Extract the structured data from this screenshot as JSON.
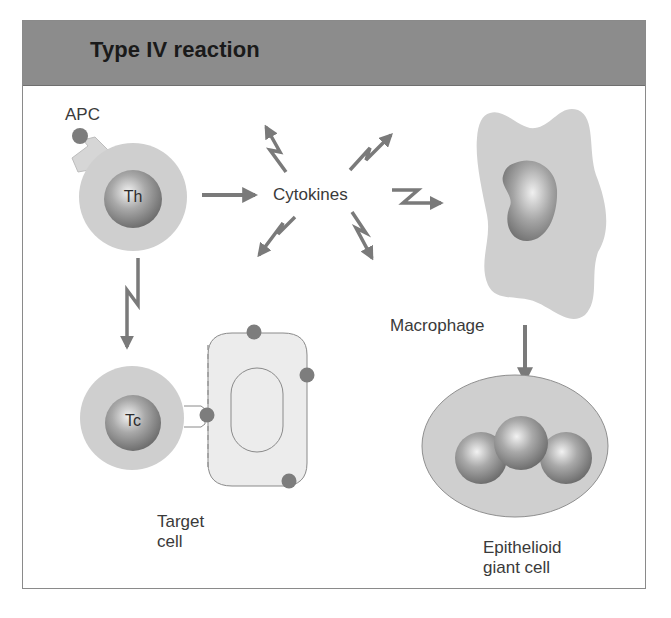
{
  "title": "Type IV reaction",
  "labels": {
    "apc": "APC",
    "th": "Th",
    "tc": "Tc",
    "cytokines": "Cytokines",
    "macrophage": "Macrophage",
    "target_cell_line1": "Target",
    "target_cell_line2": "cell",
    "giant_cell_line1": "Epithelioid",
    "giant_cell_line2": "giant cell"
  },
  "colors": {
    "header_bg": "#8c8c8c",
    "cell_fill": "#cfcfcf",
    "nucleus": "#8e8e8e",
    "arrow": "#7a7a7a",
    "antigen_dot": "#7d7d7d",
    "frame_border": "#8a8a8a"
  },
  "flow": [
    {
      "from": "Th",
      "to": "Cytokines",
      "type": "arrow"
    },
    {
      "from": "Cytokines",
      "to": "Macrophage",
      "type": "lightning-arrow"
    },
    {
      "from": "Th",
      "to": "Tc",
      "type": "lightning-arrow"
    },
    {
      "from": "Macrophage",
      "to": "Epithelioid giant cell",
      "type": "arrow"
    },
    {
      "from": "Tc",
      "to": "Target cell",
      "type": "contact"
    }
  ]
}
